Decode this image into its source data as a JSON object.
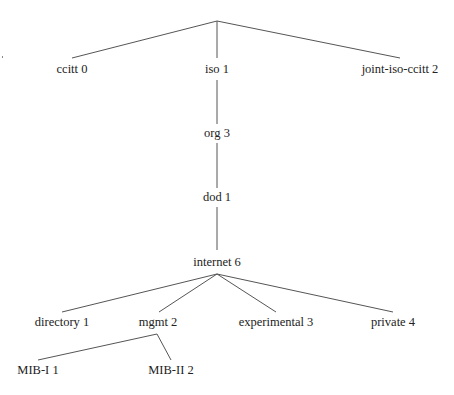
{
  "diagram": {
    "type": "tree",
    "nodes": [
      {
        "id": "ccitt",
        "label": "ccitt 0",
        "x": 72,
        "y": 69
      },
      {
        "id": "iso",
        "label": "iso 1",
        "x": 217,
        "y": 69
      },
      {
        "id": "joint",
        "label": "joint-iso-ccitt 2",
        "x": 400,
        "y": 69
      },
      {
        "id": "org",
        "label": "org 3",
        "x": 217,
        "y": 133
      },
      {
        "id": "dod",
        "label": "dod 1",
        "x": 217,
        "y": 197
      },
      {
        "id": "internet",
        "label": "internet 6",
        "x": 217,
        "y": 262
      },
      {
        "id": "directory",
        "label": "directory 1",
        "x": 62,
        "y": 322
      },
      {
        "id": "mgmt",
        "label": "mgmt 2",
        "x": 158,
        "y": 322
      },
      {
        "id": "experimental",
        "label": "experimental 3",
        "x": 276,
        "y": 322
      },
      {
        "id": "private",
        "label": "private 4",
        "x": 393,
        "y": 322
      },
      {
        "id": "mib1",
        "label": "MIB-I 1",
        "x": 38,
        "y": 370
      },
      {
        "id": "mib2",
        "label": "MIB-II 2",
        "x": 171,
        "y": 370
      }
    ],
    "edges": [
      {
        "from": "root",
        "to": "ccitt",
        "x1": 217,
        "y1": 21,
        "x2": 72,
        "y2": 58
      },
      {
        "from": "root",
        "to": "iso",
        "x1": 217,
        "y1": 21,
        "x2": 217,
        "y2": 58
      },
      {
        "from": "root",
        "to": "joint",
        "x1": 217,
        "y1": 21,
        "x2": 400,
        "y2": 58
      },
      {
        "from": "iso",
        "to": "org",
        "x1": 217,
        "y1": 80,
        "x2": 217,
        "y2": 124
      },
      {
        "from": "org",
        "to": "dod",
        "x1": 217,
        "y1": 143,
        "x2": 217,
        "y2": 188
      },
      {
        "from": "dod",
        "to": "internet",
        "x1": 217,
        "y1": 207,
        "x2": 217,
        "y2": 250
      },
      {
        "from": "internet",
        "to": "directory",
        "x1": 217,
        "y1": 274,
        "x2": 62,
        "y2": 312
      },
      {
        "from": "internet",
        "to": "mgmt",
        "x1": 217,
        "y1": 274,
        "x2": 159,
        "y2": 312
      },
      {
        "from": "internet",
        "to": "experimental",
        "x1": 217,
        "y1": 274,
        "x2": 276,
        "y2": 312
      },
      {
        "from": "internet",
        "to": "private",
        "x1": 217,
        "y1": 274,
        "x2": 393,
        "y2": 312
      },
      {
        "from": "mgmt",
        "to": "mib1",
        "x1": 157,
        "y1": 334,
        "x2": 38,
        "y2": 360
      },
      {
        "from": "mgmt",
        "to": "mib2",
        "x1": 157,
        "y1": 334,
        "x2": 171,
        "y2": 360
      }
    ],
    "colors": {
      "line": "#555555",
      "text": "#222222",
      "background": "#ffffff"
    }
  }
}
